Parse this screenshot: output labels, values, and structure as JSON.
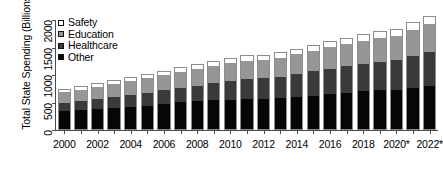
{
  "chart_data": {
    "type": "bar",
    "subtype": "stacked-bar",
    "title": "",
    "xlabel": "",
    "ylabel": "Total State Spending (Billions $)",
    "ylim": [
      0,
      2000
    ],
    "yticks": [
      0,
      500,
      1000,
      1500,
      2000
    ],
    "ytick_labels": [
      "0",
      "500",
      "1000",
      "1500",
      "2000"
    ],
    "grid": false,
    "legend_position": "top-left-inside",
    "categories": [
      "2000",
      "2001",
      "2002",
      "2003",
      "2004",
      "2005",
      "2006",
      "2007",
      "2008",
      "2009",
      "2010",
      "2011",
      "2012",
      "2013",
      "2014",
      "2015",
      "2016",
      "2017",
      "2018",
      "2019",
      "2020*",
      "2021*",
      "2022*"
    ],
    "xtick_labels_shown": [
      "2000",
      "",
      "2002",
      "",
      "2004",
      "",
      "2006",
      "",
      "2008",
      "",
      "2010",
      "",
      "2012",
      "",
      "2014",
      "",
      "2016",
      "",
      "2018",
      "",
      "2020*",
      "",
      "2022*"
    ],
    "series": [
      {
        "name": "Other",
        "color": "#060606",
        "values": [
          340,
          360,
          380,
          395,
          420,
          440,
          470,
          500,
          520,
          540,
          545,
          555,
          560,
          575,
          600,
          620,
          645,
          670,
          700,
          720,
          730,
          760,
          800
        ]
      },
      {
        "name": "Healthcare",
        "color": "#3a3a3a",
        "values": [
          160,
          175,
          195,
          215,
          230,
          245,
          255,
          270,
          290,
          320,
          355,
          380,
          385,
          395,
          420,
          455,
          480,
          495,
          510,
          525,
          545,
          590,
          620
        ]
      },
      {
        "name": "Education",
        "color": "#969696",
        "values": [
          200,
          215,
          230,
          240,
          255,
          270,
          285,
          300,
          315,
          325,
          330,
          340,
          345,
          355,
          370,
          385,
          400,
          415,
          430,
          445,
          455,
          490,
          520
        ]
      },
      {
        "name": "Safety",
        "color": "#ffffff",
        "values": [
          45,
          48,
          52,
          55,
          58,
          62,
          66,
          70,
          74,
          76,
          78,
          80,
          82,
          85,
          88,
          92,
          96,
          100,
          104,
          108,
          110,
          118,
          125
        ]
      }
    ],
    "totals": [
      745,
      798,
      857,
      905,
      963,
      1017,
      1076,
      1140,
      1199,
      1261,
      1308,
      1355,
      1372,
      1410,
      1478,
      1552,
      1621,
      1680,
      1744,
      1798,
      1840,
      1958,
      2065
    ],
    "annotations": [
      "* denotes estimated or projected values"
    ]
  },
  "legend": {
    "items": [
      {
        "label": "Safety"
      },
      {
        "label": "Education"
      },
      {
        "label": "Healthcare"
      },
      {
        "label": "Other"
      }
    ]
  }
}
